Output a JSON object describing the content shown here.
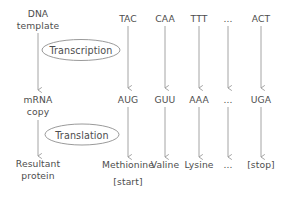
{
  "diagram": {
    "background_color": "#ffffff",
    "stroke_color": "#9a9a9a",
    "text_color": "#4d4d4d",
    "row_labels": {
      "dna": "DNA\ntemplate",
      "dna_line1": "DNA",
      "dna_line2": "template",
      "mrna_line1": "mRNA",
      "mrna_line2": "copy",
      "protein_line1": "Resultant",
      "protein_line2": "protein"
    },
    "processes": [
      {
        "name": "transcription",
        "label": "Transcription"
      },
      {
        "name": "translation",
        "label": "Translation"
      }
    ],
    "columns": [
      {
        "dna": "TAC",
        "mrna": "AUG",
        "protein": "Methionine",
        "protein_note": "[start]"
      },
      {
        "dna": "CAA",
        "mrna": "GUU",
        "protein": "Valine",
        "protein_note": ""
      },
      {
        "dna": "TTT",
        "mrna": "AAA",
        "protein": "Lysine",
        "protein_note": ""
      },
      {
        "dna": "...",
        "mrna": "...",
        "protein": "...",
        "protein_note": ""
      },
      {
        "dna": "ACT",
        "mrna": "UGA",
        "protein": "[stop]",
        "protein_note": ""
      }
    ]
  }
}
